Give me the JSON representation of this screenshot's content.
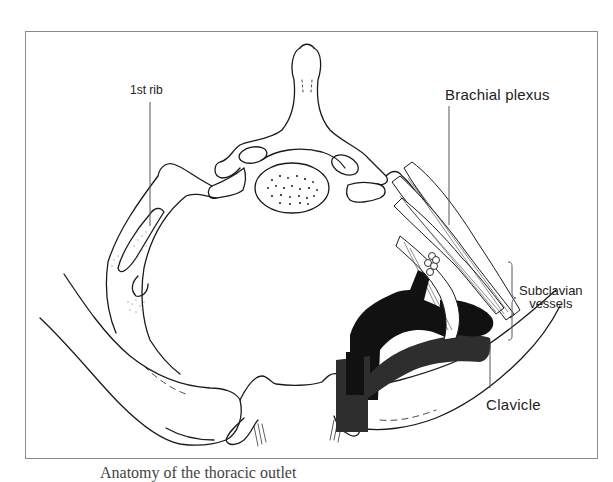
{
  "figure": {
    "labels": {
      "first_rib": "1st rib",
      "brachial_plexus": "Brachial plexus",
      "subclavian_line1": "Subclavian",
      "subclavian_line2": "vessels",
      "clavicle": "Clavicle"
    },
    "caption_partial": "Anatomy of the thoracic outlet"
  },
  "colors": {
    "line": "#1a1a1a",
    "vessel_dark": "#111111",
    "vessel_mid": "#2e2e2e",
    "frame": "#8a8a8a",
    "stipple": "#9a9a9a"
  }
}
